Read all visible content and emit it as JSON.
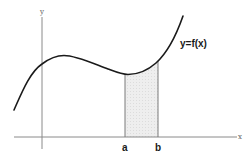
{
  "figure": {
    "type": "definite-integral-area-diagram",
    "function_label": "y=f(x)",
    "x_axis_label": "x",
    "y_axis_label": "y",
    "lower_bound_label": "a",
    "upper_bound_label": "b",
    "colors": {
      "curve": "#1a1a1a",
      "axes": "#8a8a8a",
      "shaded_region": "#ebebeb",
      "bounds": "#7a7a7a"
    }
  }
}
